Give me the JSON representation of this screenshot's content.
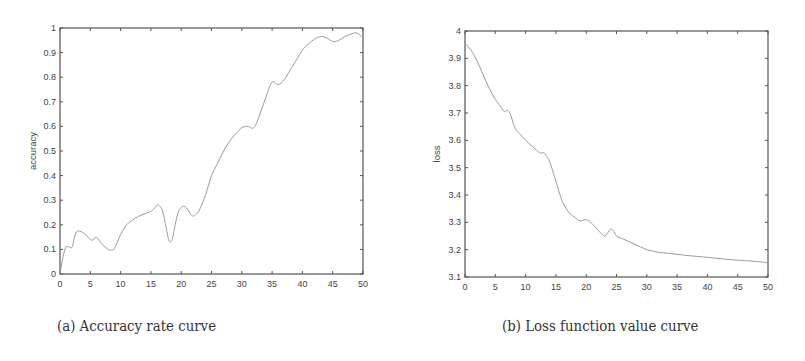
{
  "chart_data": [
    {
      "type": "line",
      "title": "",
      "caption": "(a)  Accuracy rate curve",
      "xlabel": "",
      "ylabel": "accuracy",
      "xlim": [
        0,
        50
      ],
      "ylim": [
        0,
        1
      ],
      "xticks": [
        0,
        5,
        10,
        15,
        20,
        25,
        30,
        35,
        40,
        45,
        50
      ],
      "yticks": [
        0,
        0.1,
        0.2,
        0.3,
        0.4,
        0.5,
        0.6,
        0.7,
        0.8,
        0.9,
        1
      ],
      "ytick_labels": [
        "0",
        "0.1",
        "0.2",
        "0.3",
        "0.4",
        "0.5",
        "0.6",
        "0.7",
        "0.8",
        "0.9",
        "1"
      ],
      "grid": false,
      "series": [
        {
          "name": "accuracy",
          "x": [
            0,
            0.5,
            1,
            1.5,
            2,
            2.5,
            3,
            4,
            5,
            5.5,
            6,
            7,
            8,
            8.5,
            9,
            10,
            11,
            12,
            13,
            14,
            15,
            15.5,
            16,
            16.5,
            17,
            17.5,
            18,
            18.5,
            19,
            19.5,
            20,
            20.5,
            21,
            21.5,
            22,
            22.5,
            23,
            24,
            25,
            26,
            27,
            28,
            29,
            30,
            31,
            32,
            33,
            34,
            35,
            36,
            37,
            38,
            39,
            40,
            41,
            42,
            43,
            44,
            45,
            46,
            47,
            48,
            49,
            50
          ],
          "values": [
            0.0,
            0.07,
            0.11,
            0.11,
            0.11,
            0.16,
            0.175,
            0.165,
            0.14,
            0.14,
            0.15,
            0.12,
            0.1,
            0.098,
            0.105,
            0.16,
            0.2,
            0.22,
            0.235,
            0.245,
            0.255,
            0.265,
            0.28,
            0.275,
            0.25,
            0.19,
            0.135,
            0.14,
            0.2,
            0.25,
            0.27,
            0.275,
            0.265,
            0.245,
            0.235,
            0.245,
            0.26,
            0.32,
            0.4,
            0.45,
            0.5,
            0.54,
            0.57,
            0.595,
            0.6,
            0.595,
            0.65,
            0.72,
            0.78,
            0.77,
            0.79,
            0.83,
            0.87,
            0.91,
            0.935,
            0.955,
            0.965,
            0.96,
            0.945,
            0.95,
            0.965,
            0.975,
            0.98,
            0.96
          ]
        }
      ]
    },
    {
      "type": "line",
      "title": "",
      "caption": "(b)  Loss function value curve",
      "xlabel": "",
      "ylabel": "loss",
      "xlim": [
        0,
        50
      ],
      "ylim": [
        3.1,
        4
      ],
      "xticks": [
        0,
        5,
        10,
        15,
        20,
        25,
        30,
        35,
        40,
        45,
        50
      ],
      "yticks": [
        3.1,
        3.2,
        3.3,
        3.4,
        3.5,
        3.6,
        3.7,
        3.8,
        3.9,
        4
      ],
      "ytick_labels": [
        "3.1",
        "3.2",
        "3.3",
        "3.4",
        "3.5",
        "3.6",
        "3.7",
        "3.8",
        "3.9",
        "4"
      ],
      "grid": false,
      "series": [
        {
          "name": "loss",
          "x": [
            0,
            1,
            2,
            3,
            4,
            5,
            6,
            6.5,
            7,
            7.5,
            8,
            8.5,
            9,
            10,
            11,
            12,
            12.5,
            13,
            13.5,
            14,
            15,
            16,
            17,
            18,
            19,
            20,
            21,
            22,
            23,
            23.5,
            24,
            24.5,
            25,
            26,
            27,
            28,
            29,
            30,
            31,
            32,
            33,
            35,
            37,
            40,
            43,
            46,
            48,
            50
          ],
          "values": [
            3.955,
            3.93,
            3.89,
            3.84,
            3.79,
            3.75,
            3.72,
            3.705,
            3.71,
            3.695,
            3.66,
            3.635,
            3.625,
            3.6,
            3.58,
            3.56,
            3.553,
            3.555,
            3.54,
            3.52,
            3.45,
            3.38,
            3.34,
            3.32,
            3.305,
            3.31,
            3.295,
            3.27,
            3.25,
            3.26,
            3.275,
            3.27,
            3.25,
            3.24,
            3.23,
            3.22,
            3.21,
            3.2,
            3.195,
            3.19,
            3.188,
            3.183,
            3.178,
            3.172,
            3.165,
            3.16,
            3.157,
            3.152
          ]
        }
      ]
    }
  ],
  "figure": {
    "panels": [
      {
        "caption": "(a)  Accuracy rate curve"
      },
      {
        "caption": "(b)  Loss function value curve"
      }
    ]
  }
}
